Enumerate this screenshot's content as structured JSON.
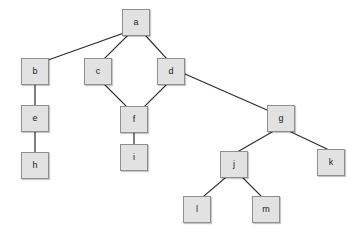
{
  "diagram": {
    "type": "node-link-graph",
    "width": 358,
    "height": 234,
    "background_color": "#ffffff",
    "node_style": {
      "fill_color": "#e2e2e2",
      "border_color": "#8f8f8f",
      "text_color": "#1a1a1a",
      "shape": "square"
    },
    "edge_style": {
      "color": "#2b2b2b",
      "width": 1.2
    },
    "nodes": [
      {
        "id": "a",
        "label": "a",
        "x": 122,
        "y": 9,
        "w": 28,
        "h": 27
      },
      {
        "id": "b",
        "label": "b",
        "x": 21,
        "y": 58,
        "w": 28,
        "h": 27
      },
      {
        "id": "c",
        "label": "c",
        "x": 84,
        "y": 58,
        "w": 28,
        "h": 27
      },
      {
        "id": "d",
        "label": "d",
        "x": 157,
        "y": 58,
        "w": 28,
        "h": 27
      },
      {
        "id": "e",
        "label": "e",
        "x": 21,
        "y": 105,
        "w": 28,
        "h": 27
      },
      {
        "id": "f",
        "label": "f",
        "x": 120,
        "y": 106,
        "w": 28,
        "h": 27
      },
      {
        "id": "g",
        "label": "g",
        "x": 267,
        "y": 105,
        "w": 28,
        "h": 27
      },
      {
        "id": "h",
        "label": "h",
        "x": 21,
        "y": 152,
        "w": 28,
        "h": 27
      },
      {
        "id": "i",
        "label": "i",
        "x": 120,
        "y": 144,
        "w": 28,
        "h": 27
      },
      {
        "id": "j",
        "label": "j",
        "x": 220,
        "y": 151,
        "w": 28,
        "h": 27
      },
      {
        "id": "k",
        "label": "k",
        "x": 317,
        "y": 149,
        "w": 28,
        "h": 27
      },
      {
        "id": "l",
        "label": "l",
        "x": 183,
        "y": 196,
        "w": 28,
        "h": 27
      },
      {
        "id": "m",
        "label": "m",
        "x": 252,
        "y": 196,
        "w": 28,
        "h": 27
      }
    ],
    "edges": [
      {
        "from": "a",
        "to": "b",
        "x1": 124,
        "y1": 33,
        "x2": 48,
        "y2": 60
      },
      {
        "from": "a",
        "to": "c",
        "x1": 127,
        "y1": 36,
        "x2": 105,
        "y2": 58
      },
      {
        "from": "a",
        "to": "d",
        "x1": 146,
        "y1": 36,
        "x2": 166,
        "y2": 58
      },
      {
        "from": "c",
        "to": "f",
        "x1": 105,
        "y1": 85,
        "x2": 126,
        "y2": 106
      },
      {
        "from": "d",
        "to": "f",
        "x1": 166,
        "y1": 85,
        "x2": 145,
        "y2": 106
      },
      {
        "from": "d",
        "to": "g",
        "x1": 185,
        "y1": 74,
        "x2": 267,
        "y2": 110
      },
      {
        "from": "b",
        "to": "e",
        "x1": 35,
        "y1": 85,
        "x2": 35,
        "y2": 105
      },
      {
        "from": "e",
        "to": "h",
        "x1": 35,
        "y1": 132,
        "x2": 35,
        "y2": 152
      },
      {
        "from": "f",
        "to": "i",
        "x1": 134,
        "y1": 133,
        "x2": 134,
        "y2": 144
      },
      {
        "from": "g",
        "to": "j",
        "x1": 272,
        "y1": 132,
        "x2": 239,
        "y2": 151
      },
      {
        "from": "g",
        "to": "k",
        "x1": 291,
        "y1": 132,
        "x2": 327,
        "y2": 149
      },
      {
        "from": "j",
        "to": "l",
        "x1": 225,
        "y1": 178,
        "x2": 204,
        "y2": 196
      },
      {
        "from": "j",
        "to": "m",
        "x1": 243,
        "y1": 178,
        "x2": 261,
        "y2": 196
      }
    ]
  }
}
